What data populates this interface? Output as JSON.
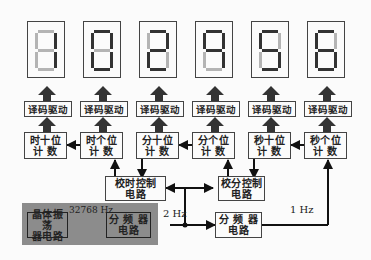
{
  "diagram": {
    "digit_colors": {
      "on": "#333333",
      "off": "#b4b4b4"
    },
    "displays": [
      {
        "name": "hour-tens-display",
        "segments": {
          "a": false,
          "b": true,
          "c": true,
          "d": false,
          "e": false,
          "f": false,
          "g": false
        }
      },
      {
        "name": "hour-ones-display",
        "segments": {
          "a": true,
          "b": true,
          "c": true,
          "d": true,
          "e": true,
          "f": true,
          "g": false
        }
      },
      {
        "name": "minute-tens-display",
        "segments": {
          "a": true,
          "b": true,
          "c": false,
          "d": true,
          "e": true,
          "f": false,
          "g": true
        }
      },
      {
        "name": "minute-ones-display",
        "segments": {
          "a": true,
          "b": true,
          "c": true,
          "d": false,
          "e": false,
          "f": true,
          "g": true
        }
      },
      {
        "name": "second-tens-display",
        "segments": {
          "a": true,
          "b": false,
          "c": true,
          "d": true,
          "e": false,
          "f": true,
          "g": true
        }
      },
      {
        "name": "second-ones-display",
        "segments": {
          "a": true,
          "b": false,
          "c": true,
          "d": true,
          "e": true,
          "f": true,
          "g": true
        }
      }
    ],
    "decoders": [
      "译码驱动",
      "译码驱动",
      "译码驱动",
      "译码驱动",
      "译码驱动",
      "译码驱动"
    ],
    "counters": [
      {
        "line1": "时十位",
        "line2": "计 数"
      },
      {
        "line1": "时个位",
        "line2": "计 数"
      },
      {
        "line1": "分十位",
        "line2": "计 数"
      },
      {
        "line1": "分个位",
        "line2": "计 数"
      },
      {
        "line1": "秒十位",
        "line2": "计 数"
      },
      {
        "line1": "秒个位",
        "line2": "计 数"
      }
    ],
    "hour_adjust": {
      "line1": "校时控制",
      "line2": "电路"
    },
    "minute_adjust": {
      "line1": "校分控制",
      "line2": "电路"
    },
    "oscillator": {
      "line1": "晶体振荡",
      "line2": "器电路"
    },
    "divider1": {
      "line1": "分 频 器",
      "line2": "电路"
    },
    "divider2": {
      "line1": "分 频 器",
      "line2": "电路"
    },
    "freq_labels": {
      "osc": "32768 Hz",
      "mid": "2 Hz",
      "sec": "1 Hz"
    }
  }
}
